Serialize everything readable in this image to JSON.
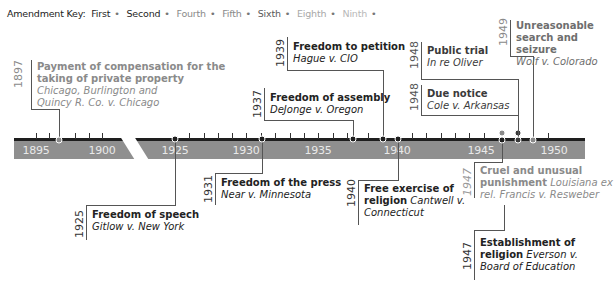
{
  "key": {
    "label": "Amendment Key:",
    "items": [
      {
        "name": "First",
        "color": "#1e1e1e"
      },
      {
        "name": "Second",
        "color": "#1e1e1e"
      },
      {
        "name": "Fourth",
        "color": "#8a8a8a"
      },
      {
        "name": "Fifth",
        "color": "#8a8a8a"
      },
      {
        "name": "Sixth",
        "color": "#5a5a5a"
      },
      {
        "name": "Eighth",
        "color": "#a8a8a8"
      },
      {
        "name": "Ninth",
        "color": "#b8b8b8"
      }
    ]
  },
  "axis": {
    "years": [
      "1895",
      "1900",
      "1925",
      "1930",
      "1935",
      "1940",
      "1945",
      "1950"
    ]
  },
  "events": [
    {
      "year": "1897",
      "title": "Payment of compensation for the taking of private property",
      "case": "Chicago, Burlington and Quincy R. Co. v. Chicago",
      "amendment": "Fifth"
    },
    {
      "year": "1925",
      "title": "Freedom of speech",
      "case": "Gitlow v. New York",
      "amendment": "First"
    },
    {
      "year": "1931",
      "title": "Freedom of the press",
      "case": "Near v. Minnesota",
      "amendment": "First"
    },
    {
      "year": "1937",
      "title": "Freedom of assembly",
      "case": "DeJonge v. Oregon",
      "amendment": "First"
    },
    {
      "year": "1939",
      "title": "Freedom to petition",
      "case": "Hague v. CIO",
      "amendment": "First"
    },
    {
      "year": "1940",
      "title": "Free exercise of religion",
      "case": "Cantwell v. Connecticut",
      "amendment": "First"
    },
    {
      "year": "1947",
      "title": "Cruel and unusual punishment",
      "case": "Louisiana ex rel. Francis v. Resweber",
      "amendment": "Eighth"
    },
    {
      "year": "1947",
      "title": "Establishment of religion",
      "case": "Everson v. Board of Education",
      "amendment": "First"
    },
    {
      "year": "1948",
      "title": "Public trial",
      "case": "In re Oliver",
      "amendment": "Sixth"
    },
    {
      "year": "1948",
      "title": "Due notice",
      "case": "Cole v. Arkansas",
      "amendment": "Sixth"
    },
    {
      "year": "1949",
      "title": "Unreasonable search and seizure",
      "case": "Wolf v. Colorado",
      "amendment": "Fourth"
    }
  ]
}
